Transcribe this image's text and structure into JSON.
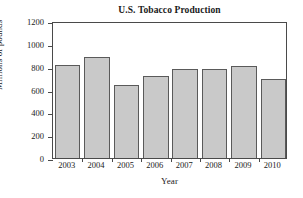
{
  "chart_data": {
    "type": "bar",
    "title": "U.S. Tobacco Production",
    "xlabel": "Year",
    "ylabel": "Millions of pounds",
    "categories": [
      "2003",
      "2004",
      "2005",
      "2006",
      "2007",
      "2008",
      "2009",
      "2010"
    ],
    "values": [
      815,
      885,
      640,
      718,
      778,
      782,
      805,
      692
    ],
    "ylim": [
      0,
      1200
    ],
    "yticks": [
      0,
      200,
      400,
      600,
      800,
      1000,
      1200
    ],
    "ytick_labels": [
      "0",
      "200",
      "400",
      "600",
      "800",
      "1000",
      "1200"
    ],
    "grid": false,
    "legend": null,
    "bar_fill_color": "#c9c9c9",
    "bar_edge_color": "#5a5a5a",
    "axis_color": "#4a4a4a",
    "background_color": "#ffffff"
  }
}
